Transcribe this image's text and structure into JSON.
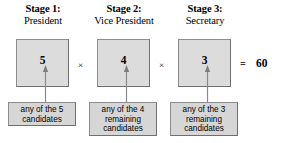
{
  "diagram": {
    "type": "counting-principle-stage-diagram",
    "stages": [
      {
        "title": "Stage 1:",
        "role": "President",
        "count": "5",
        "caption_lines": [
          "any of the 5",
          "candidates"
        ]
      },
      {
        "title": "Stage 2:",
        "role": "Vice President",
        "count": "4",
        "caption_lines": [
          "any of the 4",
          "remaining",
          "candidates"
        ]
      },
      {
        "title": "Stage 3:",
        "role": "Secretary",
        "count": "3",
        "caption_lines": [
          "any of the 3",
          "remaining",
          "candidates"
        ]
      }
    ],
    "operators": {
      "times_1": "×",
      "times_2": "×",
      "equals": "="
    },
    "total": "60",
    "colors": {
      "box_fill": "#dcdcdc",
      "caption_fill": "#d6d6d6",
      "border": "#8d8d8d",
      "arrow": "#8a8a8a",
      "text": "#000000",
      "background": "#ffffff"
    }
  }
}
